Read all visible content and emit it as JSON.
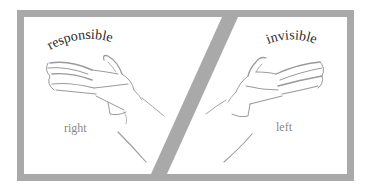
{
  "figure": {
    "frame_color": "#a9a9a9",
    "background": "#ffffff",
    "left_panel": {
      "top_label": "responsible",
      "bottom_label": "right",
      "hand": "right-hand-sketch"
    },
    "right_panel": {
      "top_label": "invisible",
      "bottom_label": "left",
      "hand": "left-hand-sketch"
    },
    "top_label_color": "#2a2a2a",
    "bottom_label_color": "#8a8a8a"
  }
}
